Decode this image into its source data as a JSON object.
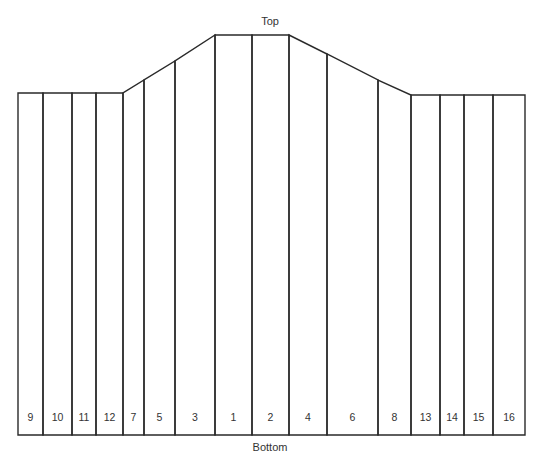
{
  "labels": {
    "top": "Top",
    "bottom": "Bottom"
  },
  "style": {
    "stroke": "#2a2a2a",
    "text": "#333333",
    "background": "#ffffff"
  },
  "columns": [
    {
      "label": "9",
      "x0": 18,
      "x1": 43,
      "top0": 93,
      "top1": 93
    },
    {
      "label": "10",
      "x0": 43,
      "x1": 72,
      "top0": 93,
      "top1": 93
    },
    {
      "label": "11",
      "x0": 72,
      "x1": 96,
      "top0": 93,
      "top1": 93
    },
    {
      "label": "12",
      "x0": 96,
      "x1": 123,
      "top0": 93,
      "top1": 93
    },
    {
      "label": "7",
      "x0": 123,
      "x1": 144,
      "top0": 93,
      "top1": 80
    },
    {
      "label": "5",
      "x0": 144,
      "x1": 175,
      "top0": 80,
      "top1": 61
    },
    {
      "label": "3",
      "x0": 175,
      "x1": 215,
      "top0": 61,
      "top1": 35
    },
    {
      "label": "1",
      "x0": 215,
      "x1": 252,
      "top0": 35,
      "top1": 35
    },
    {
      "label": "2",
      "x0": 252,
      "x1": 289,
      "top0": 35,
      "top1": 35
    },
    {
      "label": "4",
      "x0": 289,
      "x1": 327,
      "top0": 35,
      "top1": 54
    },
    {
      "label": "6",
      "x0": 327,
      "x1": 378,
      "top0": 54,
      "top1": 80
    },
    {
      "label": "8",
      "x0": 378,
      "x1": 411,
      "top0": 80,
      "top1": 95
    },
    {
      "label": "13",
      "x0": 411,
      "x1": 440,
      "top0": 95,
      "top1": 95
    },
    {
      "label": "14",
      "x0": 440,
      "x1": 464,
      "top0": 95,
      "top1": 95
    },
    {
      "label": "15",
      "x0": 464,
      "x1": 493,
      "top0": 95,
      "top1": 95
    },
    {
      "label": "16",
      "x0": 493,
      "x1": 525,
      "top0": 95,
      "top1": 95
    }
  ],
  "bottom_y": 435,
  "label_y": 421
}
